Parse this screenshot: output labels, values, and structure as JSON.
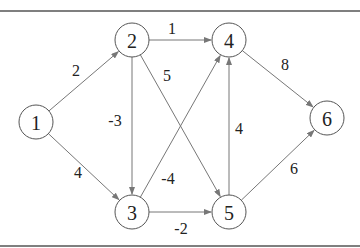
{
  "diagram": {
    "type": "directed-weighted-graph",
    "nodes": [
      {
        "id": "1",
        "label": "1",
        "x": 36,
        "y": 122
      },
      {
        "id": "2",
        "label": "2",
        "x": 132,
        "y": 40
      },
      {
        "id": "3",
        "label": "3",
        "x": 132,
        "y": 212
      },
      {
        "id": "4",
        "label": "4",
        "x": 229,
        "y": 40
      },
      {
        "id": "5",
        "label": "5",
        "x": 229,
        "y": 212
      },
      {
        "id": "6",
        "label": "6",
        "x": 327,
        "y": 118
      }
    ],
    "edges": [
      {
        "from": "1",
        "to": "2",
        "weight": "2",
        "lx": 76,
        "ly": 70
      },
      {
        "from": "1",
        "to": "3",
        "weight": "4",
        "lx": 78,
        "ly": 172
      },
      {
        "from": "2",
        "to": "4",
        "weight": "1",
        "lx": 172,
        "ly": 28
      },
      {
        "from": "2",
        "to": "3",
        "weight": "-3",
        "lx": 115,
        "ly": 120
      },
      {
        "from": "2",
        "to": "5",
        "weight": "5",
        "lx": 167,
        "ly": 75
      },
      {
        "from": "3",
        "to": "4",
        "weight": "-4",
        "lx": 168,
        "ly": 178
      },
      {
        "from": "3",
        "to": "5",
        "weight": "-2",
        "lx": 181,
        "ly": 228
      },
      {
        "from": "5",
        "to": "4",
        "weight": "4",
        "lx": 239,
        "ly": 128
      },
      {
        "from": "4",
        "to": "6",
        "weight": "8",
        "lx": 285,
        "ly": 64
      },
      {
        "from": "5",
        "to": "6",
        "weight": "6",
        "lx": 294,
        "ly": 168
      }
    ]
  }
}
